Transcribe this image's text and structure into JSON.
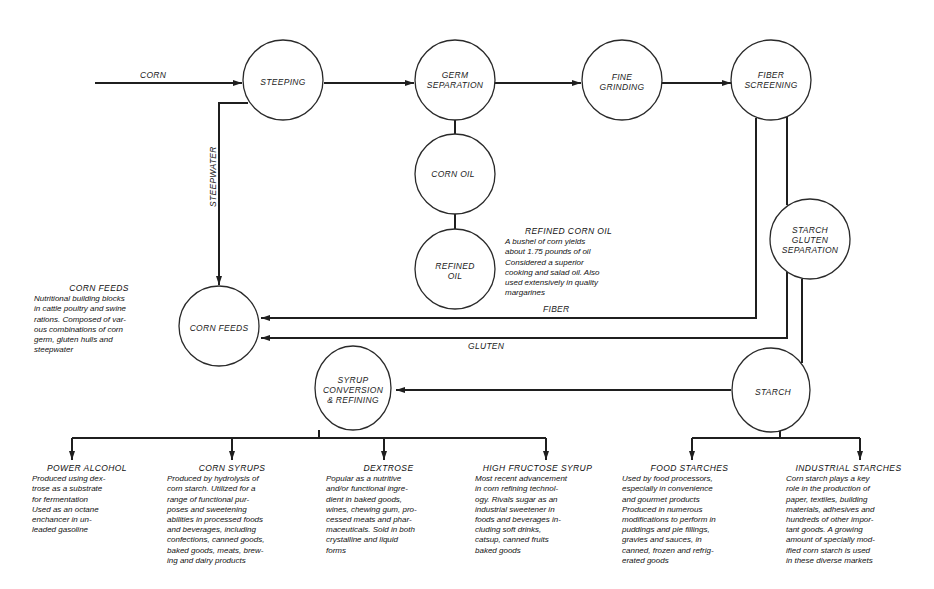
{
  "diagram": {
    "type": "process-flow",
    "colors": {
      "line": "#1f1f1f",
      "background": "#ffffff"
    },
    "nodes": {
      "steeping": "STEEPING",
      "germ_separation": "GERM\nSEPARATION",
      "fine_grinding": "FINE\nGRINDING",
      "fiber_screening": "FIBER\nSCREENING",
      "corn_oil": "CORN OIL",
      "refined_oil": "REFINED\nOIL",
      "starch_gluten_separation": "STARCH\nGLUTEN\nSEPARATION",
      "corn_feeds": "CORN FEEDS",
      "syrup_conversion": "SYRUP\nCONVERSION\n& REFINING",
      "starch": "STARCH"
    },
    "flow_labels": {
      "corn": "CORN",
      "steepwater": "STEEPWATER",
      "fiber": "FIBER",
      "gluten": "GLUTEN"
    },
    "notes": {
      "refined_corn_oil": {
        "title": "REFINED CORN OIL",
        "body": "A bushel of corn yields\nabout 1.75 pounds of oil\nConsidered a superior\ncooking and salad oil. Also\nused extensively in quality\nmargarines"
      },
      "corn_feeds": {
        "title": "CORN FEEDS",
        "body": "Nutritional building blocks\nin cattle poultry and swine\nrations. Composed of var-\nous combinations of corn\ngerm, gluten hulls and\nsteepwater"
      },
      "power_alcohol": {
        "title": "POWER ALCOHOL",
        "body": "Produced using dex-\ntrose as a substrate\nfor fermentation\nUsed as an octane\nenchancer in un-\nleaded gasoline"
      },
      "corn_syrups": {
        "title": "CORN SYRUPS",
        "body": "Produced by hydrolysis of\ncorn starch. Utilized for a\nrange of functional pur-\nposes and sweetening\nabilities in processed foods\nand beverages, including\nconfections, canned goods,\nbaked goods, meats, brew-\ning and dairy products"
      },
      "dextrose": {
        "title": "DEXTROSE",
        "body": "Popular as a nutritive\nand/or functional ingre-\ndient in baked goods,\nwines, chewing gum, pro-\ncessed meats and phar-\nmaceuticals. Sold in both\ncrystalline and liquid\nforms"
      },
      "high_fructose_syrup": {
        "title": "HIGH FRUCTOSE SYRUP",
        "body": "Most recent advancement\nin corn refining technol-\nogy. Rivals sugar as an\nindustrial sweetener in\nfoods and beverages in-\ncluding soft drinks,\ncatsup, canned fruits\nbaked goods"
      },
      "food_starches": {
        "title": "FOOD STARCHES",
        "body": "Used by food processors,\nespecially in convenience\nand gourmet products\nProduced in numerous\nmodifications to perform in\npuddings and pie fillings,\ngravies and sauces, in\ncanned, frozen and refrig-\nerated goods"
      },
      "industrial_starches": {
        "title": "INDUSTRIAL STARCHES",
        "body": "Corn starch plays a key\nrole in the production of\npaper, textiles, building\nmaterials, adhesives and\nhundreds of other impor-\ntant goods. A growing\namount of specially mod-\nified corn starch is used\nin these diverse markets"
      }
    }
  }
}
